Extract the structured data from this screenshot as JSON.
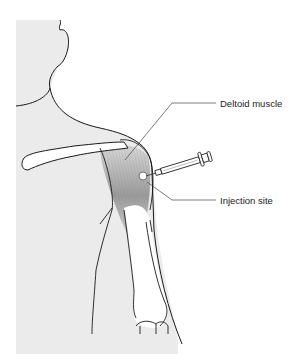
{
  "diagram": {
    "labels": {
      "deltoid": "Deltoid muscle",
      "injection_site": "Injection site"
    },
    "colors": {
      "skin": "#ececec",
      "outline": "#1a1a1a",
      "muscle": "#a8a8a8",
      "leader_line": "#444444",
      "bone": "#ffffff"
    }
  }
}
